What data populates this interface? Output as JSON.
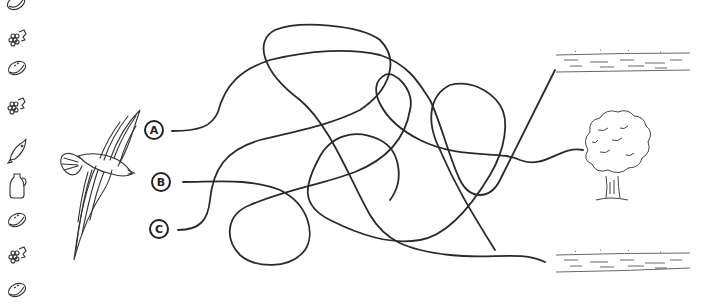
{
  "puzzle": {
    "type": "maze-path-match",
    "start_labels": [
      "A",
      "B",
      "C"
    ],
    "start_image": "dove-icon",
    "destinations": [
      "water-top-icon",
      "tree-icon",
      "water-bottom-icon"
    ]
  },
  "sidebar": {
    "icons": [
      {
        "name": "bread-icon"
      },
      {
        "name": "grapes-icon"
      },
      {
        "name": "bread-icon"
      },
      {
        "name": "grapes-icon"
      },
      {
        "name": "fish-icon"
      },
      {
        "name": "jug-icon"
      },
      {
        "name": "bread-icon"
      },
      {
        "name": "grapes-icon"
      },
      {
        "name": "bread-icon"
      }
    ]
  },
  "colors": {
    "line": "#2a2a2a",
    "background": "#ffffff"
  }
}
